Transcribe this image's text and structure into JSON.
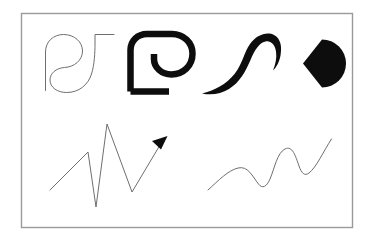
{
  "figure": {
    "background_color": "#ffffff",
    "ink_color": "#000000",
    "thin_stroke_color": "#6b6b6b",
    "frame": {
      "name": "outer-frame",
      "x": 21,
      "y": 13,
      "width": 332,
      "height": 215,
      "stroke_color": "#9a9a9a",
      "stroke_width": 1.4,
      "fill": "#ffffff"
    },
    "shapes": [
      {
        "id": "thin-spiral-outline",
        "label": "Thin outline spiral with hook",
        "row": "top",
        "column": 1,
        "style": "hairline-contour",
        "stroke_color": "#6f6f6f",
        "stroke_width": 1.0,
        "fill": "none"
      },
      {
        "id": "thick-bracket-spiral",
        "label": "Thick stroke bracket spiral",
        "row": "top",
        "column": 2,
        "style": "uniform-thick-stroke",
        "stroke_color": "#0d0d0d",
        "stroke_width": 6.5,
        "fill": "none"
      },
      {
        "id": "tapered-s-curve",
        "label": "Tapered calligraphic S curve",
        "row": "top",
        "column": 3,
        "style": "filled-tapered-brush",
        "stroke_color": "none",
        "fill": "#0d0d0d"
      },
      {
        "id": "pacman-disc",
        "label": "Filled disc with wedge notch",
        "row": "top",
        "column": 4,
        "style": "solid-fill",
        "stroke_color": "none",
        "fill": "#0d0d0d",
        "notch_direction": "left"
      },
      {
        "id": "zigzag-arrow",
        "label": "Sharp zigzag polyline with arrowhead",
        "row": "bottom",
        "column": 1,
        "style": "hairline-polyline",
        "stroke_color": "#6f6f6f",
        "stroke_width": 1.0,
        "arrowhead": true,
        "arrowhead_fill": "#0d0d0d"
      },
      {
        "id": "smooth-wave",
        "label": "Smooth rising sinusoidal wave",
        "row": "bottom",
        "column": 2,
        "style": "hairline-curve",
        "stroke_color": "#6f6f6f",
        "stroke_width": 1.0,
        "trend": "rising"
      }
    ]
  }
}
